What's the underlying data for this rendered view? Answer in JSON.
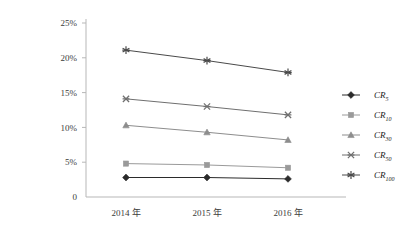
{
  "chart_data": {
    "type": "line",
    "title": "",
    "xlabel": "",
    "ylabel": "",
    "categories": [
      "2014 年",
      "2015 年",
      "2016 年"
    ],
    "ylim": [
      0,
      25
    ],
    "ytick_values": [
      0,
      5,
      10,
      15,
      20,
      25
    ],
    "ytick_labels": [
      "0",
      "5%",
      "10%",
      "15%",
      "20%",
      "25%"
    ],
    "grid": false,
    "legend_position": "right",
    "series": [
      {
        "name": "CR5",
        "label_base": "CR",
        "label_sub": "5",
        "marker": "diamond",
        "color": "#2b2b2b",
        "values": [
          2.8,
          2.8,
          2.6
        ]
      },
      {
        "name": "CR10",
        "label_base": "CR",
        "label_sub": "10",
        "marker": "square",
        "color": "#9a9a9a",
        "values": [
          4.8,
          4.6,
          4.2
        ]
      },
      {
        "name": "CR30",
        "label_base": "CR",
        "label_sub": "30",
        "marker": "triangle",
        "color": "#8d8d8d",
        "values": [
          10.3,
          9.3,
          8.2
        ]
      },
      {
        "name": "CR50",
        "label_base": "CR",
        "label_sub": "50",
        "marker": "cross-star",
        "color": "#6f6f6f",
        "values": [
          14.1,
          13.0,
          11.8
        ]
      },
      {
        "name": "CR100",
        "label_base": "CR",
        "label_sub": "100",
        "marker": "asterisk",
        "color": "#4a4a4a",
        "values": [
          21.1,
          19.6,
          17.9
        ]
      }
    ]
  },
  "axis": {
    "axis_color": "#b7b7b7"
  }
}
